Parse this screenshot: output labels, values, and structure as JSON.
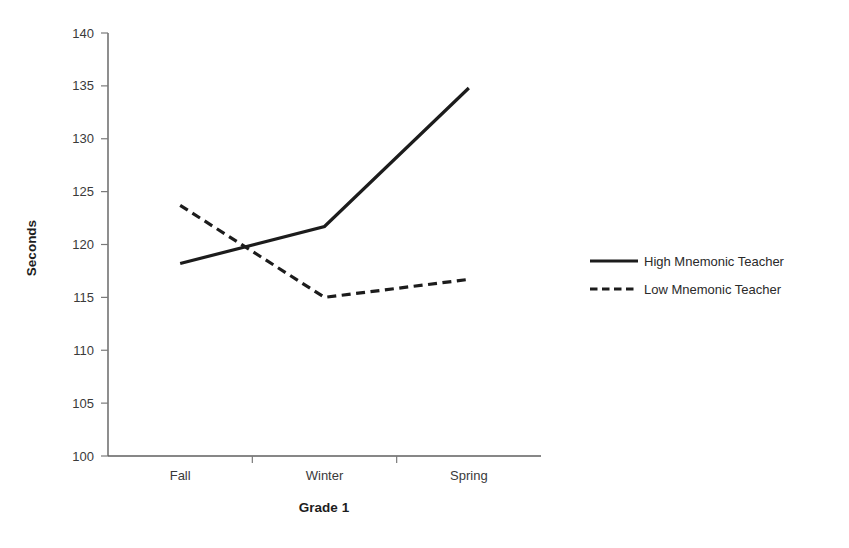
{
  "chart_data": {
    "type": "line",
    "title": "",
    "xlabel": "Grade 1",
    "ylabel": "Seconds",
    "categories": [
      "Fall",
      "Winter",
      "Spring"
    ],
    "ylim": [
      100,
      140
    ],
    "yticks": [
      100,
      105,
      110,
      115,
      120,
      125,
      130,
      135,
      140
    ],
    "ytick_labels": [
      "100",
      "105",
      "110",
      "115",
      "120",
      "125",
      "130",
      "135",
      "140"
    ],
    "grid": false,
    "legend_position": "right",
    "series": [
      {
        "name": "High Mnemonic Teacher",
        "style": "solid",
        "color": "#1c1c1c",
        "values": [
          118.2,
          121.7,
          134.8
        ]
      },
      {
        "name": "Low Mnemonic Teacher",
        "style": "dashed",
        "color": "#1c1c1c",
        "values": [
          123.7,
          115.0,
          116.7
        ]
      }
    ]
  },
  "axes": {
    "y_title": "Seconds",
    "x_title": "Grade 1"
  },
  "legend": {
    "items": [
      {
        "label": "High Mnemonic Teacher",
        "style": "solid"
      },
      {
        "label": "Low Mnemonic Teacher",
        "style": "dashed"
      }
    ]
  }
}
